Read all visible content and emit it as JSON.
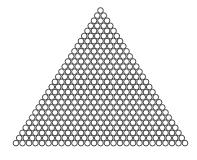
{
  "diagram": {
    "type": "triangular-circle-packing",
    "rows": 27,
    "apex": {
      "x": 100.5,
      "y": 10.5
    },
    "circle_diameter": 6.5,
    "row_spacing": 5.1,
    "stroke_color": "#333333",
    "fill_color": "#ffffff",
    "background": "#ffffff"
  }
}
